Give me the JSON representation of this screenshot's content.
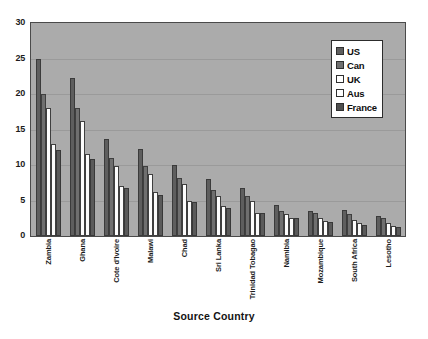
{
  "chart_data": {
    "type": "bar",
    "title": "",
    "xlabel": "Source Country",
    "ylabel": "",
    "ylim": [
      0,
      30
    ],
    "yticks": [
      0,
      5,
      10,
      15,
      20,
      25,
      30
    ],
    "grid": true,
    "legend_position": "top-right",
    "categories": [
      "Zambia",
      "Ghana",
      "Cote d'Ivoire",
      "Malawi",
      "Chad",
      "Sri Lanka",
      "Trinidad Tobagao",
      "Namibia",
      "Mozambique",
      "South Africa",
      "Lesotho"
    ],
    "series": [
      {
        "name": "US",
        "color": "#5e5e5e",
        "values": [
          24.9,
          22.3,
          13.7,
          12.2,
          10.0,
          8.0,
          6.8,
          4.3,
          3.5,
          3.6,
          2.8
        ]
      },
      {
        "name": "Can",
        "color": "#6f6f6f",
        "values": [
          20.0,
          18.0,
          11.0,
          9.9,
          8.2,
          6.5,
          5.6,
          3.5,
          3.2,
          3.1,
          2.5
        ]
      },
      {
        "name": "UK",
        "color": "#ffffff",
        "values": [
          18.0,
          16.2,
          9.9,
          8.7,
          7.3,
          5.7,
          4.9,
          3.1,
          2.6,
          2.3,
          1.8
        ]
      },
      {
        "name": "Aus",
        "color": "#ffffff",
        "values": [
          12.9,
          11.5,
          7.0,
          6.2,
          5.0,
          4.2,
          3.3,
          2.6,
          2.1,
          1.8,
          1.4
        ]
      },
      {
        "name": "France",
        "color": "#4f4f4f",
        "values": [
          12.1,
          10.9,
          6.7,
          5.8,
          4.8,
          4.0,
          3.2,
          2.5,
          2.0,
          1.6,
          1.3
        ]
      }
    ]
  },
  "legend": {
    "items": [
      {
        "label": "US"
      },
      {
        "label": "Can"
      },
      {
        "label": "UK"
      },
      {
        "label": "Aus"
      },
      {
        "label": "France"
      }
    ]
  }
}
